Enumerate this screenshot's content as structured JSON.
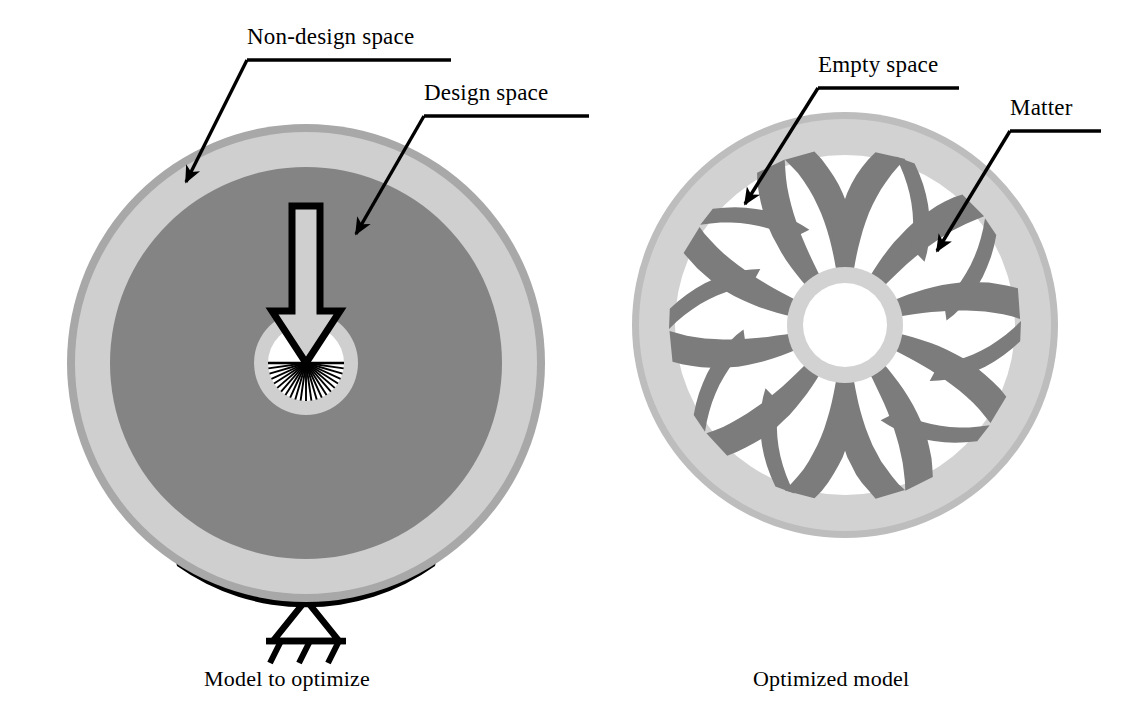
{
  "figure": {
    "kind": "engineering-diagram",
    "background_color": "#ffffff"
  },
  "palette": {
    "non_design_space": "#cfcfcf",
    "design_space": "#848484",
    "matter": "#7c7c7c",
    "rim_edge": "#a8a8a8",
    "empty_space": "#ffffff",
    "outline": "#000000",
    "support_black": "#000000"
  },
  "annotations": [
    {
      "id": "non-design-space",
      "text": "Non-design space",
      "target": "outer light-gray annulus of left wheel",
      "leader": {
        "underline": [
          247,
          60,
          450,
          60
        ],
        "elbow": [
          247,
          60
        ],
        "tip": [
          185,
          183
        ]
      }
    },
    {
      "id": "design-space",
      "text": "Design space",
      "target": "inner dark-gray disc of left wheel",
      "leader": {
        "underline": [
          424,
          116,
          588,
          116
        ],
        "elbow": [
          424,
          116
        ],
        "tip": [
          355,
          235
        ]
      }
    },
    {
      "id": "empty-space",
      "text": "Empty space",
      "target": "white void between spokes of right wheel",
      "leader": {
        "underline": [
          818,
          88,
          958,
          88
        ],
        "elbow": [
          818,
          88
        ],
        "tip": [
          744,
          205
        ]
      }
    },
    {
      "id": "matter",
      "text": "Matter",
      "target": "dark-gray optimized spoke of right wheel",
      "leader": {
        "underline": [
          1010,
          131,
          1100,
          131
        ],
        "elbow": [
          1010,
          131
        ],
        "tip": [
          936,
          252
        ]
      }
    }
  ],
  "captions": {
    "left": "Model to optimize",
    "right": "Optimized model"
  },
  "left_wheel": {
    "name": "model-to-optimize",
    "center": [
      306,
      363
    ],
    "outer_radius": 239,
    "rings": [
      {
        "name": "rim-edge",
        "outer_r": 239,
        "inner_r": 231,
        "fill": "#a8a8a8"
      },
      {
        "name": "non-design-space",
        "outer_r": 231,
        "inner_r": 196,
        "fill": "#cfcfcf"
      },
      {
        "name": "design-space",
        "outer_r": 196,
        "inner_r": 52,
        "fill": "#848484"
      },
      {
        "name": "hub-ring",
        "outer_r": 52,
        "inner_r": 38,
        "fill": "#cfcfcf"
      },
      {
        "name": "hub-bore",
        "outer_r": 38,
        "inner_r": 0,
        "fill": "#ffffff"
      }
    ],
    "load_arrow": {
      "name": "load-arrow",
      "direction": "down",
      "shaft_top_y": 206,
      "tip_y": 363,
      "shaft_half_width": 14,
      "head_half_width": 34,
      "head_height": 52
    },
    "fan": {
      "name": "radial-load-fan",
      "line_count": 23,
      "start_angle_deg": 0,
      "end_angle_deg": 180,
      "radius": 38
    },
    "support": {
      "name": "pinned-support",
      "contact_band": {
        "half_angle_deg": 34,
        "thickness": 17
      },
      "triangle": {
        "apex": [
          306,
          600
        ],
        "base_y": 641,
        "half_width": 33
      },
      "hatch_count": 3
    }
  },
  "right_wheel": {
    "name": "optimized-model",
    "center": [
      845,
      325
    ],
    "outer_radius": 213,
    "rings": [
      {
        "name": "rim-edge",
        "outer_r": 213,
        "inner_r": 206,
        "fill": "#bdbdbd"
      },
      {
        "name": "rim",
        "outer_r": 206,
        "inner_r": 170,
        "fill": "#d2d2d2"
      },
      {
        "name": "interior-void",
        "outer_r": 170,
        "inner_r": 0,
        "fill": "#ffffff"
      },
      {
        "name": "hub-ring",
        "outer_r": 58,
        "inner_r": 42,
        "fill": "#d2d2d2"
      },
      {
        "name": "hub-bore",
        "outer_r": 42,
        "inner_r": 0,
        "fill": "#ffffff"
      }
    ],
    "spokes": {
      "name": "optimized-spokes",
      "count": 10,
      "fill": "#7c7c7c",
      "angles_deg": [
        90,
        126,
        162,
        198,
        234,
        270,
        306,
        342,
        18,
        54
      ],
      "forked_angles_deg": [
        90,
        270
      ],
      "hub_half_width_deg": 9,
      "rim_half_width_deg": 5,
      "fork_half_angle_deg": 15
    }
  }
}
